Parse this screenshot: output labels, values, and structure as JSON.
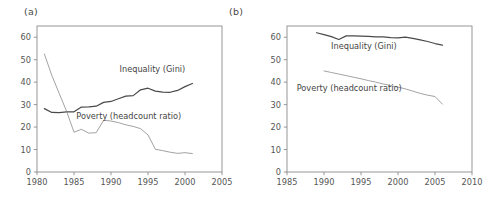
{
  "figure": {
    "background": "#ffffff",
    "width": 499,
    "height": 202,
    "line_color_inequality": "#4a4a4a",
    "line_color_poverty": "#8a8a8a",
    "axis_color": "#8c8c8c"
  },
  "panels": [
    {
      "key": "a",
      "label": "(a)",
      "chart_data": {
        "type": "line",
        "title": "",
        "xlabel": "",
        "ylabel": "",
        "xlim": [
          1980,
          2005
        ],
        "ylim": [
          0,
          65
        ],
        "xticks": [
          1980,
          1985,
          1990,
          1995,
          2000,
          2005
        ],
        "yticks": [
          0,
          10,
          20,
          30,
          40,
          50,
          60
        ],
        "grid": false,
        "legend": "inline-annotations",
        "annotations": [
          {
            "text": "Inequality (Gini)",
            "x": 1995.6,
            "y": 44.5
          },
          {
            "text": "Poverty (headcount ratio)",
            "x": 1992.4,
            "y": 23.8
          }
        ],
        "series": [
          {
            "name": "Inequality (Gini)",
            "color": "#4a4a4a",
            "x": [
              1981,
              1982,
              1983,
              1984,
              1985,
              1986,
              1987,
              1988,
              1989,
              1990,
              1991,
              1992,
              1993,
              1994,
              1995,
              1996,
              1997,
              1998,
              1999,
              2000,
              2001
            ],
            "values": [
              28.2,
              26.5,
              26.4,
              26.8,
              26.8,
              28.9,
              29.0,
              29.3,
              31.0,
              31.4,
              32.6,
              33.8,
              34.0,
              36.6,
              37.3,
              36.0,
              35.6,
              35.5,
              36.3,
              38.0,
              39.4
            ]
          },
          {
            "name": "Poverty (headcount ratio)",
            "color": "#8a8a8a",
            "x": [
              1981,
              1982,
              1983,
              1984,
              1985,
              1986,
              1987,
              1988,
              1989,
              1990,
              1991,
              1992,
              1993,
              1994,
              1995,
              1996,
              1997,
              1998,
              1999,
              2000,
              2001
            ],
            "values": [
              52.5,
              43.0,
              35.0,
              27.0,
              17.7,
              19.0,
              17.3,
              17.5,
              23.0,
              22.7,
              22.0,
              21.0,
              20.3,
              19.3,
              16.5,
              10.1,
              9.5,
              8.8,
              8.3,
              8.6,
              8.2
            ]
          }
        ]
      }
    },
    {
      "key": "b",
      "label": "(b)",
      "chart_data": {
        "type": "line",
        "title": "",
        "xlabel": "",
        "ylabel": "",
        "xlim": [
          1985,
          2010
        ],
        "ylim": [
          0,
          65
        ],
        "xticks": [
          1985,
          1990,
          1995,
          2000,
          2005,
          2010
        ],
        "yticks": [
          0,
          10,
          20,
          30,
          40,
          50,
          60
        ],
        "grid": false,
        "legend": "inline-annotations",
        "annotations": [
          {
            "text": "Inequality (Gini)",
            "x": 1995.4,
            "y": 54.8
          },
          {
            "text": "Poverty (headcount ratio)",
            "x": 1993.4,
            "y": 36.0
          }
        ],
        "series": [
          {
            "name": "Inequality (Gini)",
            "color": "#4a4a4a",
            "x": [
              1989,
              1990,
              1991,
              1992,
              1993,
              1994,
              1995,
              1996,
              1997,
              1998,
              1999,
              2000,
              2001,
              2002,
              2003,
              2004,
              2005,
              2006
            ],
            "values": [
              62.0,
              61.2,
              60.3,
              59.0,
              60.6,
              60.6,
              60.5,
              60.4,
              60.2,
              60.2,
              59.8,
              59.7,
              60.0,
              59.5,
              58.8,
              58.1,
              57.2,
              56.5
            ]
          },
          {
            "name": "Poverty (headcount ratio)",
            "color": "#8a8a8a",
            "x": [
              1990,
              1991,
              1992,
              1993,
              1994,
              1995,
              1996,
              1997,
              1998,
              1999,
              2000,
              2001,
              2002,
              2003,
              2004,
              2005,
              2006
            ],
            "values": [
              45.0,
              44.3,
              43.6,
              42.9,
              42.2,
              41.5,
              40.7,
              40.0,
              39.2,
              38.5,
              37.8,
              37.0,
              36.0,
              35.0,
              34.2,
              33.6,
              30.2
            ]
          }
        ]
      }
    }
  ]
}
